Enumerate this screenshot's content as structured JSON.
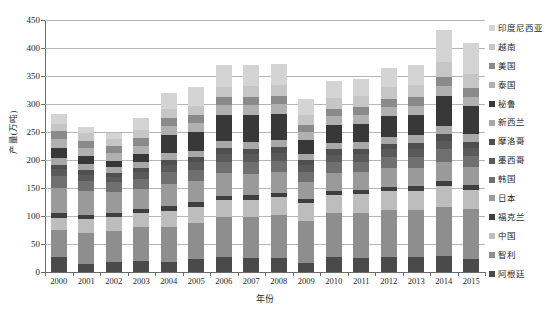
{
  "chart_data": {
    "type": "bar",
    "stacked": true,
    "title": "",
    "xlabel": "年份",
    "ylabel": "产量(万吨)",
    "ylim": [
      0,
      450
    ],
    "ytick_step": 50,
    "yticks": [
      450,
      400,
      350,
      300,
      250,
      200,
      150,
      100,
      50,
      0
    ],
    "grid": true,
    "legend_position": "right",
    "categories": [
      "2000",
      "2001",
      "2002",
      "2003",
      "2004",
      "2005",
      "2006",
      "2007",
      "2008",
      "2009",
      "2010",
      "2011",
      "2012",
      "2013",
      "2014",
      "2015"
    ],
    "series": [
      {
        "name": "阿根廷",
        "color": "#4a4a4a",
        "values": [
          27,
          14,
          17,
          20,
          17,
          23,
          27,
          25,
          25,
          16,
          26,
          25,
          27,
          26,
          28,
          24
        ]
      },
      {
        "name": "智利",
        "color": "#8e8e8e",
        "values": [
          48,
          55,
          56,
          60,
          63,
          65,
          71,
          74,
          77,
          76,
          80,
          81,
          84,
          85,
          89,
          88
        ]
      },
      {
        "name": "中国",
        "color": "#bdbdbd",
        "values": [
          22,
          25,
          26,
          26,
          29,
          29,
          30,
          30,
          32,
          31,
          31,
          33,
          33,
          34,
          36,
          35
        ]
      },
      {
        "name": "福克兰",
        "color": "#3f3f3f",
        "values": [
          8,
          7,
          6,
          7,
          9,
          8,
          8,
          8,
          8,
          7,
          7,
          7,
          8,
          8,
          9,
          8
        ]
      },
      {
        "name": "日本",
        "color": "#9a9a9a",
        "values": [
          45,
          43,
          38,
          36,
          40,
          38,
          40,
          38,
          37,
          31,
          33,
          32,
          33,
          33,
          35,
          33
        ]
      },
      {
        "name": "韩国",
        "color": "#707070",
        "values": [
          22,
          19,
          17,
          18,
          20,
          20,
          21,
          21,
          20,
          18,
          19,
          19,
          20,
          20,
          22,
          20
        ]
      },
      {
        "name": "墨西哥",
        "color": "#5a5a5a",
        "values": [
          12,
          11,
          10,
          11,
          13,
          13,
          14,
          14,
          14,
          12,
          13,
          13,
          14,
          14,
          15,
          14
        ]
      },
      {
        "name": "摩洛哥",
        "color": "#4f4f4f",
        "values": [
          8,
          8,
          7,
          8,
          9,
          9,
          10,
          10,
          10,
          9,
          10,
          10,
          10,
          11,
          12,
          11
        ]
      },
      {
        "name": "新西兰",
        "color": "#a8a8a8",
        "values": [
          12,
          11,
          10,
          11,
          12,
          12,
          13,
          13,
          13,
          11,
          12,
          12,
          13,
          13,
          14,
          13
        ]
      },
      {
        "name": "秘鲁",
        "color": "#383838",
        "values": [
          18,
          14,
          12,
          14,
          32,
          33,
          47,
          48,
          47,
          24,
          31,
          32,
          36,
          36,
          55,
          50
        ]
      },
      {
        "name": "泰国",
        "color": "#b0b0b0",
        "values": [
          16,
          15,
          14,
          15,
          17,
          16,
          17,
          17,
          17,
          15,
          16,
          16,
          17,
          17,
          18,
          17
        ]
      },
      {
        "name": "美国",
        "color": "#8a8a8a",
        "values": [
          14,
          13,
          12,
          13,
          14,
          14,
          15,
          15,
          15,
          13,
          14,
          14,
          15,
          15,
          16,
          15
        ]
      },
      {
        "name": "越南",
        "color": "#c6c6c6",
        "values": [
          12,
          13,
          13,
          14,
          16,
          17,
          18,
          19,
          20,
          18,
          19,
          20,
          21,
          22,
          26,
          25
        ]
      },
      {
        "name": "印度尼西亚",
        "color": "#d4d4d4",
        "values": [
          18,
          12,
          10,
          22,
          29,
          33,
          38,
          37,
          37,
          28,
          30,
          31,
          34,
          36,
          58,
          56
        ]
      }
    ],
    "totals": [
      282,
      260,
      253,
      275,
      309,
      320,
      346,
      344,
      345,
      293,
      304,
      314,
      331,
      336,
      393,
      379
    ]
  }
}
